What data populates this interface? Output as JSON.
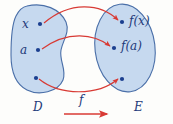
{
  "figure": {
    "type": "function-mapping-diagram",
    "colors": {
      "set_fill": "#bcd2ec",
      "set_stroke": "#4a6fa8",
      "arrow": "#d83a34",
      "label": "#243a7a",
      "background": "#fdfdfb"
    },
    "sets": [
      {
        "id": "domain",
        "label": "D",
        "shape": "bean",
        "elements": [
          {
            "id": "pt-x",
            "label": "x",
            "cx": 40,
            "cy": 24
          },
          {
            "id": "pt-a",
            "label": "a",
            "cx": 38,
            "cy": 50
          },
          {
            "id": "pt-unlabeled-domain",
            "label": "",
            "cx": 36,
            "cy": 78
          }
        ]
      },
      {
        "id": "codomain",
        "label": "E",
        "shape": "ellipse",
        "elements": [
          {
            "id": "pt-fx",
            "label": "f(x)",
            "cx": 122,
            "cy": 22
          },
          {
            "id": "pt-fa",
            "label": "f(a)",
            "cx": 114,
            "cy": 48
          },
          {
            "id": "pt-unlabeled-codomain",
            "label": "",
            "cx": 122,
            "cy": 79
          }
        ]
      }
    ],
    "mappings": [
      {
        "id": "map-x-to-fx",
        "from": "pt-x",
        "to": "pt-fx",
        "curve": "arc-up"
      },
      {
        "id": "map-a-to-fa",
        "from": "pt-a",
        "to": "pt-fa",
        "curve": "arc-up"
      },
      {
        "id": "map-unlabeled",
        "from": "pt-unlabeled-domain",
        "to": "pt-unlabeled-codomain",
        "curve": "arc-down"
      }
    ],
    "function_label": "f",
    "function_arrow": {
      "id": "function-direction-arrow",
      "x1": 64,
      "y1": 114,
      "x2": 110,
      "y2": 114
    }
  }
}
